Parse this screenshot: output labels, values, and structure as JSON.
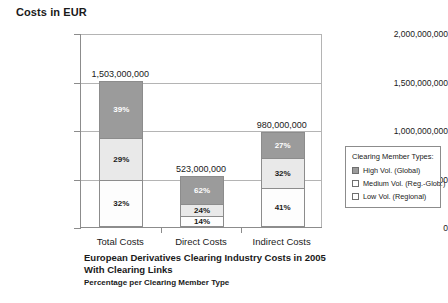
{
  "chart_data": {
    "type": "bar",
    "subtype": "stacked-column-100-percent-labeled",
    "title": "European Derivatives Clearing Industry Costs in 2005 With Clearing Links",
    "subtitle": "Percentage per Clearing Member Type",
    "axis_title": "Costs in EUR",
    "xlabel": "",
    "ylabel": "Costs in EUR",
    "ylim": [
      0,
      2000000000
    ],
    "grid": true,
    "legend_position": "right",
    "categories": [
      "Total Costs",
      "Direct Costs",
      "Indirect Costs"
    ],
    "totals": [
      1503000000,
      523000000,
      980000000
    ],
    "total_labels": [
      "1,503,000,000",
      "523,000,000",
      "980,000,000"
    ],
    "ytick_values": [
      0,
      500000000,
      1000000000,
      1500000000,
      2000000000
    ],
    "ytick_labels": [
      "0",
      "500,000,000",
      "1,000,000,000",
      "1,500,000,000",
      "2,000,000,000"
    ],
    "series": [
      {
        "name": "High Vol. (Global)",
        "key": "high",
        "color": "#9b9b9b",
        "values": [
          39,
          62,
          27
        ],
        "value_labels": [
          "39%",
          "62%",
          "27%"
        ]
      },
      {
        "name": "Medium Vol. (Reg.-Glob.)",
        "key": "medium",
        "color": "#e9e9e9",
        "values": [
          29,
          24,
          32
        ],
        "value_labels": [
          "29%",
          "24%",
          "32%"
        ]
      },
      {
        "name": "Low Vol. (Regional)",
        "key": "low",
        "color": "#fdfdfd",
        "values": [
          32,
          14,
          41
        ],
        "value_labels": [
          "32%",
          "14%",
          "41%"
        ]
      }
    ]
  },
  "axis": {
    "title": "Costs in EUR",
    "ticks": [
      {
        "label": "2,000,000,000"
      },
      {
        "label": "1,500,000,000"
      },
      {
        "label": "1,000,000,000"
      },
      {
        "label": "500,000,000"
      },
      {
        "label": "0"
      }
    ]
  },
  "bars": [
    {
      "category": "Total Costs",
      "total_label": "1,503,000,000",
      "segments": [
        {
          "label": "39%",
          "type": "high"
        },
        {
          "label": "29%",
          "type": "medium"
        },
        {
          "label": "32%",
          "type": "low"
        }
      ]
    },
    {
      "category": "Direct Costs",
      "total_label": "523,000,000",
      "segments": [
        {
          "label": "62%",
          "type": "high"
        },
        {
          "label": "24%",
          "type": "medium"
        },
        {
          "label": "14%",
          "type": "low"
        }
      ]
    },
    {
      "category": "Indirect Costs",
      "total_label": "980,000,000",
      "segments": [
        {
          "label": "27%",
          "type": "high"
        },
        {
          "label": "32%",
          "type": "medium"
        },
        {
          "label": "41%",
          "type": "low"
        }
      ]
    }
  ],
  "legend": {
    "title": "Clearing Member Types:",
    "items": [
      {
        "label": "High Vol. (Global)",
        "swatch": "high"
      },
      {
        "label": "Medium Vol. (Reg.-Glob.)",
        "swatch": "medium"
      },
      {
        "label": "Low Vol. (Regional)",
        "swatch": "low"
      }
    ]
  },
  "caption": {
    "line1": "European Derivatives Clearing Industry Costs in 2005",
    "line2": "With Clearing Links",
    "line3": "Percentage per Clearing Member Type"
  }
}
